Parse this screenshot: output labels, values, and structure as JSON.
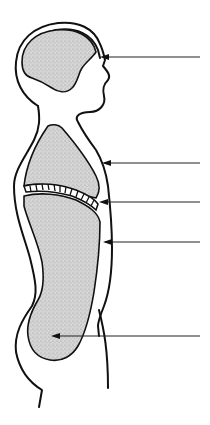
{
  "diagram": {
    "type": "anatomical-line-art",
    "colors": {
      "line": "#111111",
      "fill_stipple_base": "#d9d9d9",
      "background": "#ffffff"
    },
    "regions": [
      {
        "id": "cranial-cavity",
        "label": ""
      },
      {
        "id": "thoracic-cavity",
        "label": ""
      },
      {
        "id": "diaphragm",
        "label": ""
      },
      {
        "id": "abdominal-cavity",
        "label": ""
      },
      {
        "id": "pelvic-cavity",
        "label": ""
      }
    ],
    "pointers": [
      {
        "id": "pointer-1",
        "target": "cranial-cavity",
        "y": 57,
        "x_tip": 103,
        "x_end": 200,
        "label": ""
      },
      {
        "id": "pointer-2",
        "target": "thoracic-wall",
        "y": 163,
        "x_tip": 102,
        "x_end": 200,
        "label": ""
      },
      {
        "id": "pointer-3",
        "target": "diaphragm",
        "y": 202,
        "x_tip": 100,
        "x_end": 200,
        "label": ""
      },
      {
        "id": "pointer-4",
        "target": "abdominal-wall",
        "y": 242,
        "x_tip": 103,
        "x_end": 200,
        "label": ""
      },
      {
        "id": "pointer-5",
        "target": "pelvic-cavity",
        "y": 336,
        "x_tip": 52,
        "x_end": 200,
        "label": ""
      }
    ]
  }
}
